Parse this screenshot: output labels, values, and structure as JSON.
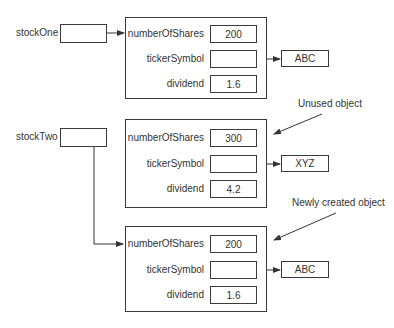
{
  "variables": [
    {
      "name": "stockOne"
    },
    {
      "name": "stockTwo"
    }
  ],
  "objects": [
    {
      "fields": [
        {
          "label": "numberOfShares",
          "value": "200"
        },
        {
          "label": "tickerSymbol",
          "value": ""
        },
        {
          "label": "dividend",
          "value": "1.6"
        }
      ],
      "ticker_target": "ABC"
    },
    {
      "fields": [
        {
          "label": "numberOfShares",
          "value": "300"
        },
        {
          "label": "tickerSymbol",
          "value": ""
        },
        {
          "label": "dividend",
          "value": "4.2"
        }
      ],
      "ticker_target": "XYZ",
      "annotation": "Unused object"
    },
    {
      "fields": [
        {
          "label": "numberOfShares",
          "value": "200"
        },
        {
          "label": "tickerSymbol",
          "value": ""
        },
        {
          "label": "dividend",
          "value": "1.6"
        }
      ],
      "ticker_target": "ABC",
      "annotation": "Newly created object"
    }
  ],
  "colors": {
    "line": "#333333",
    "text": "#333333",
    "background": "#ffffff"
  }
}
